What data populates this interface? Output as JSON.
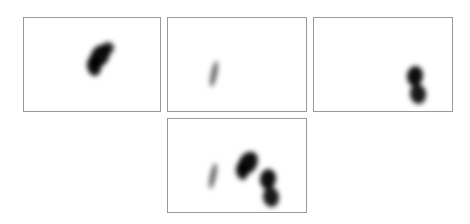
{
  "figure": {
    "panels": [
      {
        "id": "panel-1",
        "x": 23,
        "y": 17,
        "w": 138,
        "h": 95,
        "blobs": [
          {
            "cx": 76,
            "cy": 38,
            "rx": 9,
            "ry": 12,
            "rot": 30,
            "opacity": 0.95
          },
          {
            "cx": 70,
            "cy": 48,
            "rx": 7,
            "ry": 10,
            "rot": -10,
            "opacity": 0.95
          },
          {
            "cx": 84,
            "cy": 30,
            "rx": 6,
            "ry": 6,
            "rot": 0,
            "opacity": 0.85
          }
        ]
      },
      {
        "id": "panel-2",
        "x": 167,
        "y": 17,
        "w": 140,
        "h": 95,
        "blobs": [
          {
            "cx": 46,
            "cy": 56,
            "rx": 3,
            "ry": 13,
            "rot": 12,
            "opacity": 0.6
          }
        ]
      },
      {
        "id": "panel-3",
        "x": 313,
        "y": 17,
        "w": 140,
        "h": 95,
        "blobs": [
          {
            "cx": 101,
            "cy": 58,
            "rx": 8,
            "ry": 10,
            "rot": 10,
            "opacity": 0.95
          },
          {
            "cx": 104,
            "cy": 76,
            "rx": 8,
            "ry": 10,
            "rot": -10,
            "opacity": 0.9
          }
        ]
      },
      {
        "id": "panel-4",
        "x": 167,
        "y": 118,
        "w": 140,
        "h": 95,
        "blobs": [
          {
            "cx": 45,
            "cy": 57,
            "rx": 3,
            "ry": 13,
            "rot": 12,
            "opacity": 0.6
          },
          {
            "cx": 80,
            "cy": 44,
            "rx": 9,
            "ry": 12,
            "rot": 30,
            "opacity": 0.95
          },
          {
            "cx": 74,
            "cy": 52,
            "rx": 6,
            "ry": 9,
            "rot": -10,
            "opacity": 0.9
          },
          {
            "cx": 100,
            "cy": 60,
            "rx": 8,
            "ry": 10,
            "rot": 10,
            "opacity": 0.95
          },
          {
            "cx": 103,
            "cy": 78,
            "rx": 8,
            "ry": 10,
            "rot": -10,
            "opacity": 0.9
          }
        ]
      }
    ],
    "colors": {
      "border": "#9a9a9a",
      "blob": "#000000",
      "background": "#ffffff"
    }
  }
}
